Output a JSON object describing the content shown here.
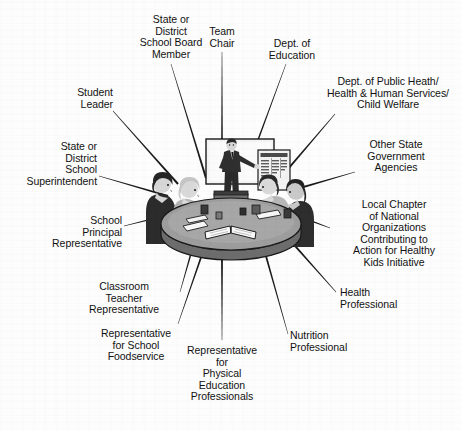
{
  "figure": {
    "background_color": "#fdfdfd",
    "line_color": "#1a1a1a",
    "text_color": "#121212",
    "width": 461,
    "height": 430
  },
  "center_illustration": {
    "name": "team-meeting-illustration",
    "description": "Meeting room scene: a standing presenter at a whiteboard gestures toward a flipchart while four people sit around an oval conference table with papers, an open book and cups.",
    "elements": {
      "whiteboard_label": "whiteboard",
      "flipchart_label": "flipchart",
      "table_label": "oval conference table",
      "presenter_label": "standing presenter",
      "seated_count": 4
    },
    "colors": {
      "table_top": "#9b9b9b",
      "table_edge": "#6e6e6e",
      "board_fill": "#f2f2f2",
      "board_border": "#1a1a1a",
      "suit_dark": "#2b2b2b",
      "suit_mid": "#8d8d8d",
      "hair_light": "#c9c9c9",
      "skin": "#d8d8d8"
    }
  },
  "labels": [
    {
      "id": "state-or-district-school-board-member",
      "text": "State or\nDistrict\nSchool Board\nMember",
      "align": "center",
      "x": 171,
      "y": 14,
      "leader": [
        [
          171,
          64
        ],
        [
          206,
          178
        ]
      ]
    },
    {
      "id": "team-chair",
      "text": "Team\nChair",
      "align": "center",
      "x": 222,
      "y": 26,
      "leader": [
        [
          222,
          52
        ],
        [
          222,
          178
        ]
      ]
    },
    {
      "id": "dept-of-education",
      "text": "Dept. of\nEducation",
      "align": "center",
      "x": 292,
      "y": 38,
      "leader": [
        [
          286,
          64
        ],
        [
          244,
          178
        ]
      ]
    },
    {
      "id": "dept-of-public-health-human-services-child-welfare",
      "text": "Dept. of Public Heath/\nHealth & Human Services/\nChild Welfare",
      "align": "center",
      "x": 388,
      "y": 76,
      "leader": [
        [
          335,
          114
        ],
        [
          282,
          176
        ]
      ]
    },
    {
      "id": "other-state-government-agencies",
      "text": "Other State\nGovernment\nAgencies",
      "align": "center",
      "x": 396,
      "y": 139,
      "leader": [
        [
          355,
          172
        ],
        [
          300,
          188
        ]
      ]
    },
    {
      "id": "local-chapter-national-organizations",
      "text": "Local Chapter\nof National\nOrganizations\nContributing to\nAction for Healthy\nKids Initiative",
      "align": "center",
      "x": 394,
      "y": 199,
      "leader": [
        [
          330,
          228
        ],
        [
          298,
          216
        ]
      ]
    },
    {
      "id": "health-professional",
      "text": "Health\nProfessional",
      "align": "left",
      "x": 340,
      "y": 287,
      "leader": [
        [
          336,
          292
        ],
        [
          288,
          238
        ]
      ]
    },
    {
      "id": "nutrition-professional",
      "text": "Nutrition\nProfessional",
      "align": "left",
      "x": 290,
      "y": 330,
      "leader": [
        [
          288,
          334
        ],
        [
          262,
          242
        ]
      ]
    },
    {
      "id": "representative-for-physical-education-professionals",
      "text": "Representative\nfor\nPhysical\nEducation\nProfessionals",
      "align": "center",
      "x": 222,
      "y": 345,
      "leader": [
        [
          222,
          340
        ],
        [
          222,
          245
        ]
      ]
    },
    {
      "id": "representative-for-school-foodservice",
      "text": "Representative\nfor School\nFoodservice",
      "align": "center",
      "x": 136,
      "y": 328,
      "leader": [
        [
          178,
          324
        ],
        [
          206,
          243
        ]
      ]
    },
    {
      "id": "classroom-teacher-representative",
      "text": "Classroom\nTeacher\nRepresentative",
      "align": "center",
      "x": 124,
      "y": 281,
      "leader": [
        [
          180,
          292
        ],
        [
          196,
          236
        ]
      ]
    },
    {
      "id": "school-principal-representative",
      "text": "School\nPrincipal\nRepresentative",
      "align": "right",
      "x": 122,
      "y": 215,
      "leader": [
        [
          124,
          226
        ],
        [
          176,
          213
        ]
      ]
    },
    {
      "id": "state-or-district-school-superintendent",
      "text": "State or\nDistrict\nSchool\nSuperintendent",
      "align": "right",
      "x": 97,
      "y": 141,
      "leader": [
        [
          99,
          176
        ],
        [
          168,
          196
        ]
      ]
    },
    {
      "id": "student-leader",
      "text": "Student\nLeader",
      "align": "right",
      "x": 113,
      "y": 87,
      "leader": [
        [
          113,
          111
        ],
        [
          178,
          184
        ]
      ]
    }
  ]
}
